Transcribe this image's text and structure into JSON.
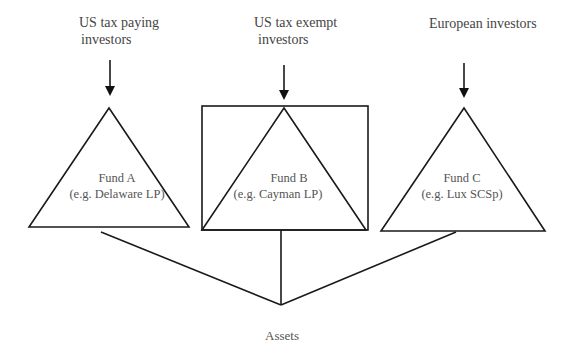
{
  "investors": {
    "a": {
      "line1": "US tax paying",
      "line2": "investors"
    },
    "b": {
      "line1": "US tax exempt",
      "line2": "investors"
    },
    "c": {
      "line1": "European investors"
    }
  },
  "funds": {
    "a": {
      "name": "Fund A",
      "example": "(e.g. Delaware LP)"
    },
    "b": {
      "name": "Fund B",
      "example": "(e.g. Cayman LP)"
    },
    "c": {
      "name": "Fund C",
      "example": "(e.g. Lux SCSp)"
    }
  },
  "assets": {
    "label": "Assets"
  },
  "colors": {
    "stroke": "#1a1a1a",
    "text": "#444444"
  }
}
